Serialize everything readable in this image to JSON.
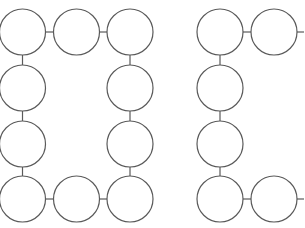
{
  "diagram": {
    "stroke_color": "#5a5a5a",
    "background": "#ffffff",
    "radius": 23,
    "groups": [
      {
        "name": "letter-c-left",
        "circles": [
          {
            "cx": 22.5,
            "cy": 32
          },
          {
            "cx": 76.5,
            "cy": 32
          },
          {
            "cx": 130,
            "cy": 32
          },
          {
            "cx": 22.5,
            "cy": 88
          },
          {
            "cx": 130,
            "cy": 88
          },
          {
            "cx": 22.5,
            "cy": 144
          },
          {
            "cx": 130,
            "cy": 144
          },
          {
            "cx": 22.5,
            "cy": 199
          },
          {
            "cx": 76.5,
            "cy": 199
          },
          {
            "cx": 130,
            "cy": 199
          }
        ],
        "links": [
          [
            0,
            1
          ],
          [
            1,
            2
          ],
          [
            0,
            3
          ],
          [
            3,
            5
          ],
          [
            5,
            7
          ],
          [
            7,
            8
          ],
          [
            8,
            9
          ],
          [
            2,
            4
          ],
          [
            4,
            6
          ],
          [
            6,
            9
          ]
        ]
      },
      {
        "name": "letter-c-right",
        "circles": [
          {
            "cx": 220,
            "cy": 32
          },
          {
            "cx": 274,
            "cy": 32
          },
          {
            "cx": 220,
            "cy": 88
          },
          {
            "cx": 220,
            "cy": 144
          },
          {
            "cx": 220,
            "cy": 199
          },
          {
            "cx": 274,
            "cy": 199
          }
        ],
        "links": [
          [
            0,
            1
          ],
          [
            0,
            2
          ],
          [
            2,
            3
          ],
          [
            3,
            4
          ],
          [
            4,
            5
          ]
        ],
        "stubs": [
          {
            "x1": 297,
            "y1": 32,
            "x2": 304,
            "y2": 32
          },
          {
            "x1": 297,
            "y1": 199,
            "x2": 304,
            "y2": 199
          }
        ]
      }
    ]
  }
}
